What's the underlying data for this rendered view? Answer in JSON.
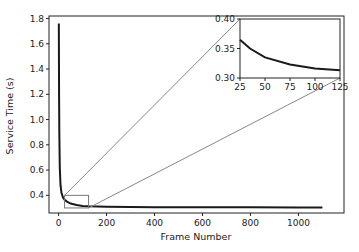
{
  "chart_data": {
    "type": "line",
    "title": "",
    "xlabel": "Frame Number",
    "ylabel": "Service Time (s)",
    "xlim": [
      -40,
      1190
    ],
    "ylim": [
      0.26,
      1.82
    ],
    "xticks": [
      "0",
      "200",
      "400",
      "600",
      "800",
      "1000"
    ],
    "yticks": [
      "0.4",
      "0.6",
      "0.8",
      "1.0",
      "1.2",
      "1.4",
      "1.6",
      "1.8"
    ],
    "grid": false,
    "legend": null,
    "series": [
      {
        "name": "Service Time",
        "color": "#1a1a1a",
        "x": [
          1,
          2,
          3,
          5,
          8,
          12,
          18,
          25,
          35,
          50,
          75,
          100,
          125,
          200,
          300,
          400,
          600,
          800,
          1000,
          1100
        ],
        "y": [
          1.76,
          1.2,
          0.9,
          0.62,
          0.48,
          0.42,
          0.385,
          0.365,
          0.35,
          0.335,
          0.323,
          0.316,
          0.313,
          0.309,
          0.307,
          0.306,
          0.305,
          0.305,
          0.304,
          0.304
        ]
      }
    ],
    "inset": {
      "xlim": [
        25,
        125
      ],
      "ylim": [
        0.3,
        0.4
      ],
      "xticks": [
        "25",
        "50",
        "75",
        "100",
        "125"
      ],
      "yticks": [
        "0.30",
        "0.35",
        "0.40"
      ],
      "zoom_region": {
        "x": [
          25,
          125
        ],
        "y": [
          0.3,
          0.4
        ]
      }
    }
  }
}
